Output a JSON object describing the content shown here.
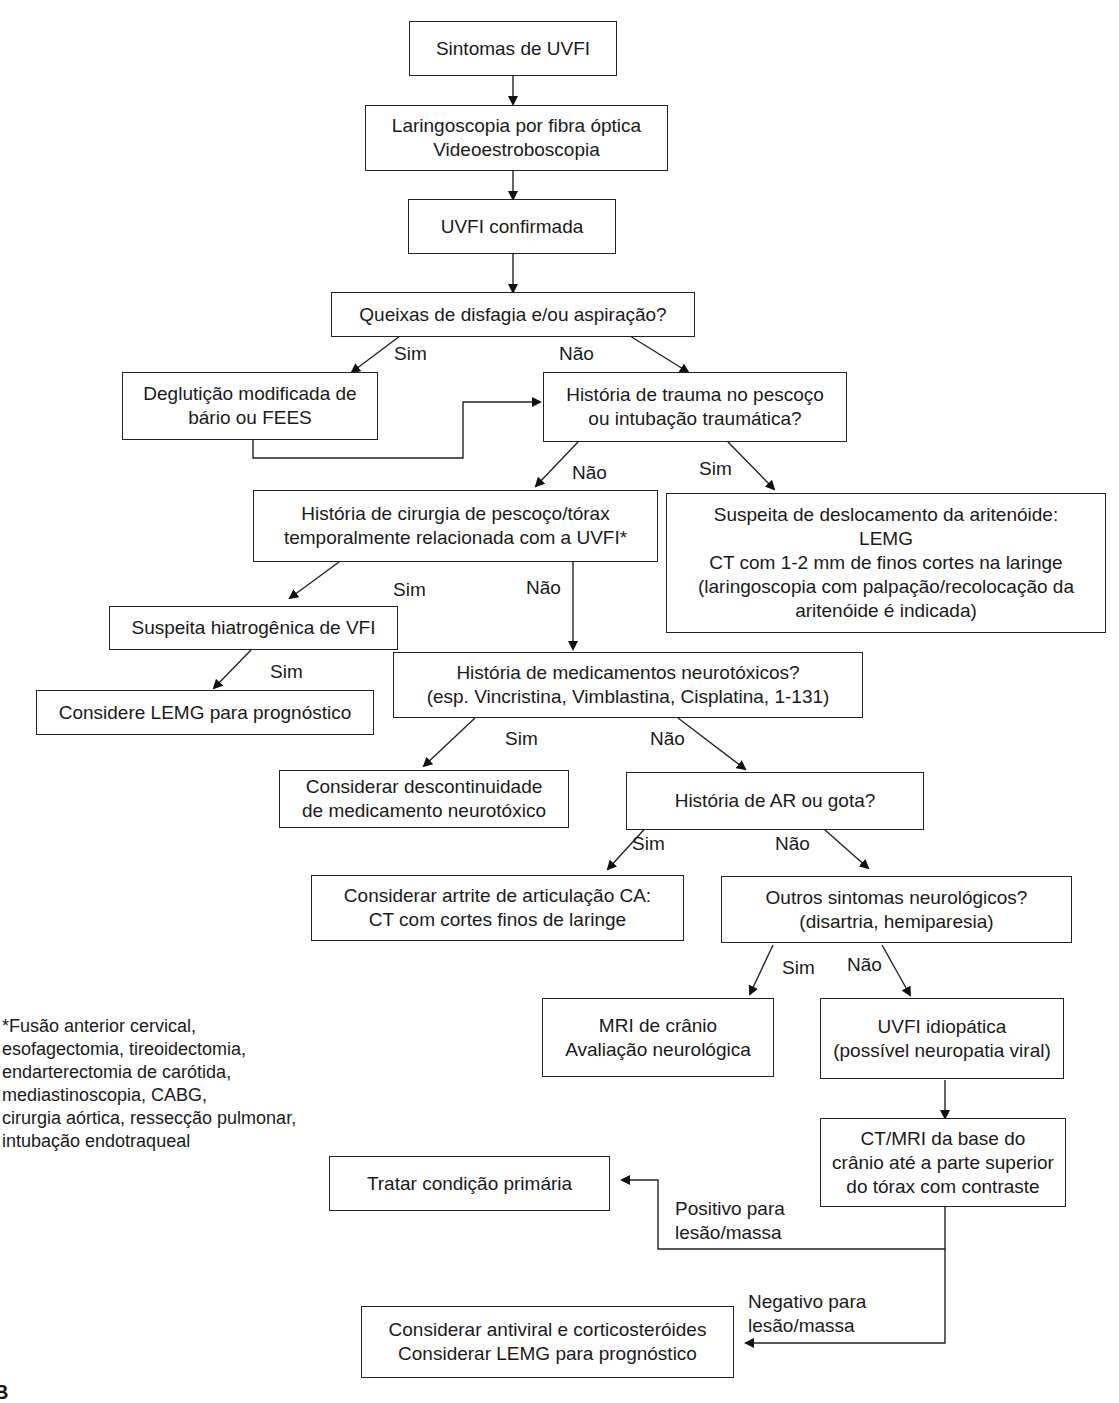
{
  "diagram": {
    "type": "flowchart",
    "nodes": {
      "n1": "Sintomas de UVFI",
      "n2": "Laringoscopia por fibra óptica\nVideoestroboscopia",
      "n3": "UVFI confirmada",
      "n4": "Queixas de disfagia e/ou aspiração?",
      "n5": "Deglutição modificada de\nbário ou FEES",
      "n6": "História de trauma no pescoço\nou intubação traumática?",
      "n7": "História de cirurgia de pescoço/tórax\ntemporalmente relacionada com a UVFI*",
      "n8": "Suspeita de deslocamento da aritenóide:\nLEMG\nCT com 1-2 mm de finos cortes na laringe\n(laringoscopia com palpação/recolocação da\naritenóide é indicada)",
      "n9": "Suspeita hiatrogênica de VFI",
      "n10": "Considere LEMG para prognóstico",
      "n11": "História de medicamentos neurotóxicos?\n(esp. Vincristina, Vimblastina, Cisplatina, 1-131)",
      "n12": "Considerar descontinuidade\nde medicamento neurotóxico",
      "n13": "História de AR ou gota?",
      "n14": "Considerar artrite de articulação CA:\nCT com cortes finos de laringe",
      "n15": "Outros sintomas neurológicos?\n(disartria, hemiparesia)",
      "n16": "MRI de crânio\nAvaliação neurológica",
      "n17": "UVFI idiopática\n(possível neuropatia viral)",
      "n18": "CT/MRI da base do\ncrânio até a parte superior\ndo tórax com contraste",
      "n19": "Tratar condição primária",
      "n20": "Considerar antiviral e corticosteróides\nConsiderar LEMG para prognóstico"
    },
    "edge_labels": {
      "n4_sim": "Sim",
      "n4_nao": "Não",
      "n6_nao": "Não",
      "n6_sim": "Sim",
      "n7_sim": "Sim",
      "n7_nao": "Não",
      "n9_sim": "Sim",
      "n11_sim": "Sim",
      "n11_nao": "Não",
      "n13_sim": "Sim",
      "n13_nao": "Não",
      "n15_sim": "Sim",
      "n15_nao": "Não",
      "n18_pos": "Positivo para\nlesão/massa",
      "n18_neg": "Negativo para\nlesão/massa"
    },
    "footnote": "*Fusão anterior cervical,\nesofagectomia, tireoidectomia,\nendarterectomia de carótida,\nmediastinoscopia, CABG,\ncirurgia aórtica, ressecção pulmonar,\nintubação endotraqueal",
    "figure_letter": "B"
  }
}
